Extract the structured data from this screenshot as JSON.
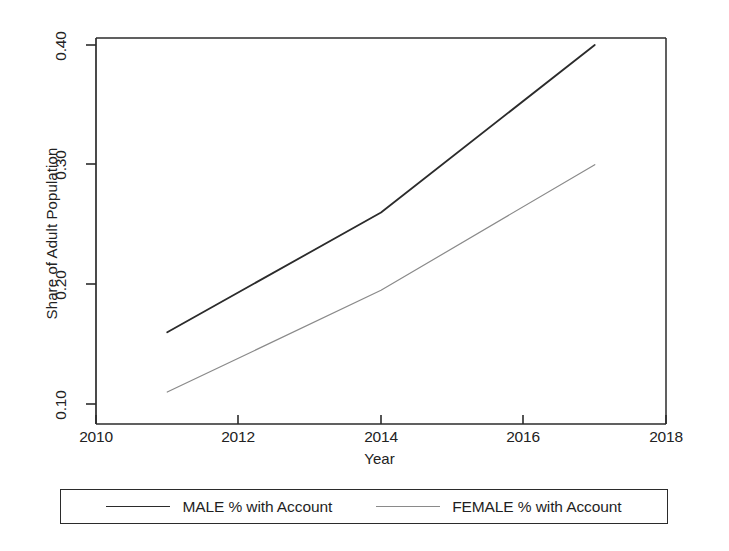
{
  "chart_data": {
    "type": "line",
    "title": "",
    "xlabel": "Year",
    "ylabel": "Share of Adult Population",
    "xlim": [
      2010,
      2018
    ],
    "ylim": [
      0.095,
      0.405
    ],
    "xticks": [
      2010,
      2012,
      2014,
      2016,
      2018
    ],
    "xtick_labels": [
      "2010",
      "2012",
      "2014",
      "2016",
      "2018"
    ],
    "yticks": [
      0.1,
      0.2,
      0.3,
      0.4
    ],
    "ytick_labels": [
      "0.10",
      "0.20",
      "0.30",
      "0.40"
    ],
    "grid": false,
    "legend_position": "below",
    "x": [
      2011,
      2014,
      2017
    ],
    "series": [
      {
        "name": "MALE % with Account",
        "color": "#2b2b2b",
        "linewidth": 1.8,
        "values": [
          0.16,
          0.26,
          0.4
        ]
      },
      {
        "name": "FEMALE % with Account",
        "color": "#8a8a8a",
        "linewidth": 1.2,
        "values": [
          0.11,
          0.195,
          0.3
        ]
      }
    ]
  },
  "axes": {
    "y_title": "Share of Adult Population",
    "x_title": "Year",
    "y_tick_labels": [
      "0.40",
      "0.30",
      "0.20",
      "0.10"
    ],
    "x_tick_labels": [
      "2010",
      "2012",
      "2014",
      "2016",
      "2018"
    ]
  },
  "legend": {
    "entries": [
      {
        "label": "MALE % with Account",
        "color": "#2b2b2b"
      },
      {
        "label": "FEMALE % with Account",
        "color": "#8a8a8a"
      }
    ]
  },
  "colors": {
    "male_line": "#2b2b2b",
    "female_line": "#8a8a8a",
    "axis": "#2b2b2b",
    "background": "#ffffff"
  }
}
